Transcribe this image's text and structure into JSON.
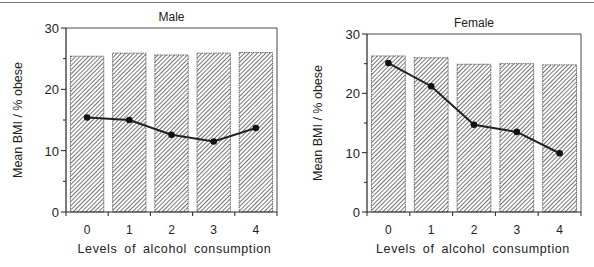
{
  "chart_data": [
    {
      "type": "bar+line",
      "title": "Male",
      "xlabel": "Levels of alcohol consumption",
      "ylabel": "Mean BMI / % obese",
      "categories": [
        "0",
        "1",
        "2",
        "3",
        "4"
      ],
      "ylim": [
        0,
        30
      ],
      "yticks": [
        0,
        10,
        20,
        30
      ],
      "series": [
        {
          "name": "Mean BMI",
          "kind": "bar",
          "pattern": "diagonal-hatch",
          "values": [
            25.4,
            25.9,
            25.6,
            25.9,
            26.0
          ]
        },
        {
          "name": "% obese",
          "kind": "line",
          "marker": "filled-circle",
          "values": [
            15.4,
            15.0,
            12.6,
            11.5,
            13.7
          ]
        }
      ],
      "grid": false,
      "legend": null
    },
    {
      "type": "bar+line",
      "title": "Female",
      "xlabel": "Levels of alcohol consumption",
      "ylabel": "Mean BMI / % obese",
      "categories": [
        "0",
        "1",
        "2",
        "3",
        "4"
      ],
      "ylim": [
        0,
        30
      ],
      "yticks": [
        0,
        10,
        20,
        30
      ],
      "series": [
        {
          "name": "Mean BMI",
          "kind": "bar",
          "pattern": "diagonal-hatch",
          "values": [
            26.3,
            26.0,
            24.9,
            25.0,
            24.8
          ]
        },
        {
          "name": "% obese",
          "kind": "line",
          "marker": "filled-circle",
          "values": [
            25.1,
            21.2,
            14.7,
            13.5,
            9.9
          ]
        }
      ],
      "grid": false,
      "legend": null
    }
  ],
  "panels": [
    {
      "title": "Male",
      "xlabel": "Levels of alcohol consumption",
      "ylabel": "Mean BMI / % obese"
    },
    {
      "title": "Female",
      "xlabel": "Levels of alcohol consumption",
      "ylabel": "Mean BMI / % obese"
    }
  ],
  "colors": {
    "axis": "#222222",
    "bar_fill": "#ffffff",
    "hatch": "#333333",
    "line": "#222222"
  }
}
